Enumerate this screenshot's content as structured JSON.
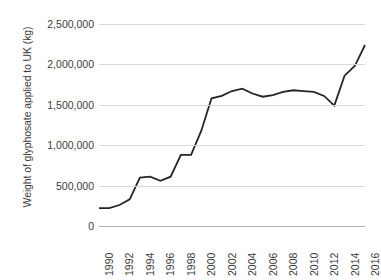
{
  "chart_data": {
    "type": "line",
    "title": "",
    "xlabel": "",
    "ylabel": "Weight of glyphosate applied to UK (kg)",
    "x": [
      1990,
      1991,
      1992,
      1993,
      1994,
      1995,
      1996,
      1997,
      1998,
      1999,
      2000,
      2001,
      2002,
      2003,
      2004,
      2005,
      2006,
      2007,
      2008,
      2009,
      2010,
      2011,
      2012,
      2013,
      2014,
      2015,
      2016
    ],
    "values": [
      220000,
      220000,
      260000,
      330000,
      600000,
      610000,
      560000,
      610000,
      880000,
      880000,
      1180000,
      1580000,
      1610000,
      1670000,
      1700000,
      1640000,
      1600000,
      1620000,
      1660000,
      1680000,
      1670000,
      1660000,
      1610000,
      1490000,
      1860000,
      1980000,
      2240000
    ],
    "ylim": [
      0,
      2500000
    ],
    "ytick_values": [
      0,
      500000,
      1000000,
      1500000,
      2000000,
      2500000
    ],
    "ytick_labels": [
      "0",
      "500,000",
      "1,000,000",
      "1,500,000",
      "2,000,000",
      "2,500,000"
    ],
    "xtick_values": [
      1990,
      1992,
      1994,
      1996,
      1998,
      2000,
      2002,
      2004,
      2006,
      2008,
      2010,
      2012,
      2014,
      2016
    ],
    "xtick_labels": [
      "1990",
      "1992",
      "1994",
      "1996",
      "1998",
      "2000",
      "2002",
      "2004",
      "2006",
      "2008",
      "2010",
      "2012",
      "2014",
      "2016"
    ],
    "grid": true,
    "legend": false,
    "line_color": "#262626",
    "gridline_color": "#d9d9d9",
    "background_color": "#ffffff"
  }
}
